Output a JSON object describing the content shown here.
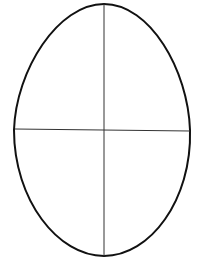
{
  "diagram": {
    "title": "",
    "shape": "egg-outline",
    "divisions": [
      "vertical-axis",
      "horizontal-axis"
    ],
    "colors": {
      "background": "#ffffff",
      "outline": "#111111",
      "axis": "#333333"
    }
  }
}
